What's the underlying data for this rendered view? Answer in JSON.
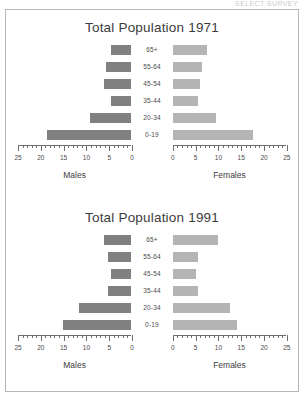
{
  "page": {
    "cut_off_header": "SELECT SURVEY"
  },
  "colors": {
    "male_bar": "#808080",
    "female_bar": "#b4b4b4",
    "axis": "#6e6e6e",
    "text": "#3c3c3c",
    "frame": "#b8b8b8"
  },
  "charts": [
    {
      "title": "Total Population 1971",
      "left_axis_name": "Males",
      "right_axis_name": "Females",
      "age_groups": [
        "65+",
        "55-64",
        "45-54",
        "35-44",
        "20-34",
        "0-19"
      ],
      "left_ticks": [
        "25",
        "20",
        "15",
        "10",
        "5",
        "0"
      ],
      "right_ticks": [
        "0",
        "5",
        "10",
        "15",
        "20",
        "25"
      ],
      "axis_max": 25,
      "males": [
        4.5,
        5.5,
        6.0,
        4.5,
        9.0,
        18.5
      ],
      "females": [
        7.5,
        6.5,
        6.0,
        5.5,
        9.5,
        17.5
      ]
    },
    {
      "title": "Total Population 1991",
      "left_axis_name": "Males",
      "right_axis_name": "Females",
      "age_groups": [
        "65+",
        "55-64",
        "45-54",
        "35-44",
        "20-34",
        "0-19"
      ],
      "left_ticks": [
        "25",
        "20",
        "15",
        "10",
        "5",
        "0"
      ],
      "right_ticks": [
        "0",
        "5",
        "10",
        "15",
        "20",
        "25"
      ],
      "axis_max": 25,
      "males": [
        6.0,
        5.0,
        4.5,
        5.0,
        11.5,
        15.0
      ],
      "females": [
        10.0,
        5.5,
        5.0,
        5.5,
        12.5,
        14.0
      ]
    }
  ],
  "chart_data": {
    "type": "bar",
    "chart_kind": "population-pyramid",
    "xlabel": "Population (millions)",
    "ylabel": "Age group",
    "xlim": [
      0,
      25
    ],
    "grid": false,
    "legend": "none",
    "panels": [
      {
        "title": "Total Population 1971",
        "categories": [
          "65+",
          "55-64",
          "45-54",
          "35-44",
          "20-34",
          "0-19"
        ],
        "series": [
          {
            "name": "Males",
            "side": "left",
            "values": [
              4.5,
              5.5,
              6.0,
              4.5,
              9.0,
              18.5
            ]
          },
          {
            "name": "Females",
            "side": "right",
            "values": [
              7.5,
              6.5,
              6.0,
              5.5,
              9.5,
              17.5
            ]
          }
        ],
        "xtick_labels_left": [
          "25",
          "20",
          "15",
          "10",
          "5",
          "0"
        ],
        "xtick_labels_right": [
          "0",
          "5",
          "10",
          "15",
          "20",
          "25"
        ]
      },
      {
        "title": "Total Population 1991",
        "categories": [
          "65+",
          "55-64",
          "45-54",
          "35-44",
          "20-34",
          "0-19"
        ],
        "series": [
          {
            "name": "Males",
            "side": "left",
            "values": [
              6.0,
              5.0,
              4.5,
              5.0,
              11.5,
              15.0
            ]
          },
          {
            "name": "Females",
            "side": "right",
            "values": [
              10.0,
              5.5,
              5.0,
              5.5,
              12.5,
              14.0
            ]
          }
        ],
        "xtick_labels_left": [
          "25",
          "20",
          "15",
          "10",
          "5",
          "0"
        ],
        "xtick_labels_right": [
          "0",
          "5",
          "10",
          "15",
          "20",
          "25"
        ]
      }
    ]
  }
}
